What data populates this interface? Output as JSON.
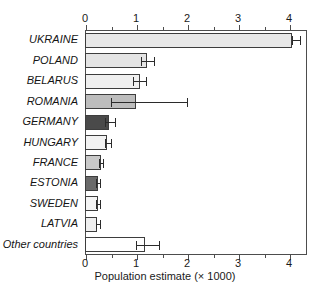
{
  "chart_data": {
    "type": "bar",
    "orientation": "horizontal",
    "title": "",
    "xlabel": "Population estimate (× 1000)",
    "ylabel": "",
    "xlim": [
      0,
      4.35
    ],
    "xticks": [
      0,
      1,
      2,
      3,
      4
    ],
    "xticklabels": [
      "0",
      "1",
      "2",
      "3",
      "4"
    ],
    "minor_xticks": [
      0.5,
      1.5,
      2.5,
      3.5
    ],
    "grid": false,
    "legend": null,
    "axis_top": true,
    "axis_bottom": true,
    "categories": [
      "UKRAINE",
      "POLAND",
      "BELARUS",
      "ROMANIA",
      "GERMANY",
      "HUNGARY",
      "FRANCE",
      "ESTONIA",
      "SWEDEN",
      "LATVIA",
      "Other countries"
    ],
    "values": [
      4.05,
      1.22,
      1.08,
      0.99,
      0.48,
      0.44,
      0.31,
      0.26,
      0.25,
      0.24,
      1.17
    ],
    "error_low": [
      4.05,
      1.1,
      0.95,
      0.5,
      0.4,
      0.4,
      0.27,
      0.22,
      0.22,
      0.21,
      1.0
    ],
    "error_high": [
      4.22,
      1.35,
      1.2,
      2.0,
      0.58,
      0.5,
      0.35,
      0.3,
      0.3,
      0.29,
      1.45
    ],
    "bar_colors": [
      "#e8e8e8",
      "#e4e4e4",
      "#efefef",
      "#bdbdbd",
      "#4a4a4a",
      "#f2f2f2",
      "#c9c9c9",
      "#6a6a6a",
      "#f4f4f4",
      "#efefef",
      "#ffffff"
    ],
    "bar_edge_color": "#3d3d3d",
    "error_color": "#2b2b2b",
    "frame_color": "#4d4d4d",
    "background": "#ffffff"
  }
}
